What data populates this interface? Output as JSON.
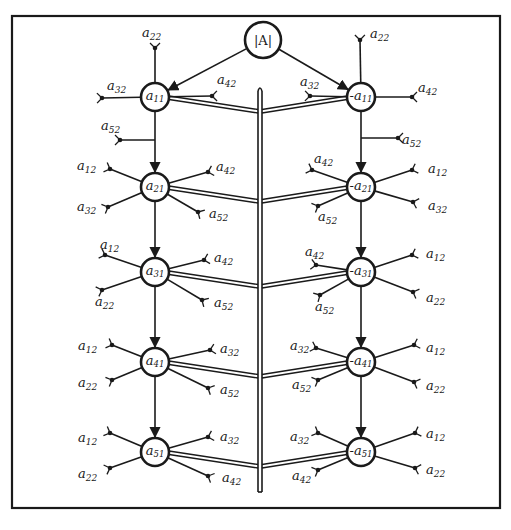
{
  "diagram": {
    "frame": {
      "x": 12,
      "y": 16,
      "width": 488,
      "height": 492
    },
    "colors": {
      "ink": "#1a1a1a",
      "paper": "#ffffff"
    },
    "root": {
      "id": "A",
      "label": "|A|",
      "x": 263,
      "y": 40,
      "r": 18
    },
    "trunk": {
      "x": 260,
      "y_top": 88,
      "y_bottom": 492
    },
    "left_nodes": [
      {
        "id": "a11",
        "base": "a",
        "sub": "11",
        "sign": "",
        "x": 155,
        "y": 97
      },
      {
        "id": "a21",
        "base": "a",
        "sub": "21",
        "sign": "",
        "x": 155,
        "y": 187
      },
      {
        "id": "a31",
        "base": "a",
        "sub": "31",
        "sign": "",
        "x": 155,
        "y": 272
      },
      {
        "id": "a41",
        "base": "a",
        "sub": "41",
        "sign": "",
        "x": 155,
        "y": 362
      },
      {
        "id": "a51",
        "base": "a",
        "sub": "51",
        "sign": "",
        "x": 155,
        "y": 452
      }
    ],
    "right_nodes": [
      {
        "id": "-a11",
        "base": "a",
        "sub": "11",
        "sign": "-",
        "x": 361,
        "y": 97
      },
      {
        "id": "-a21",
        "base": "a",
        "sub": "21",
        "sign": "-",
        "x": 361,
        "y": 187
      },
      {
        "id": "-a31",
        "base": "a",
        "sub": "31",
        "sign": "-",
        "x": 361,
        "y": 272
      },
      {
        "id": "-a41",
        "base": "a",
        "sub": "41",
        "sign": "-",
        "x": 361,
        "y": 362
      },
      {
        "id": "-a51",
        "base": "a",
        "sub": "51",
        "sign": "-",
        "x": 361,
        "y": 452
      }
    ],
    "branches": [
      {
        "node": "a11",
        "label": "a",
        "sub": "22",
        "x2": 155,
        "y2": 48,
        "lx": 142,
        "ly": 37
      },
      {
        "node": "a11",
        "label": "a",
        "sub": "32",
        "x2": 102,
        "y2": 98,
        "lx": 107,
        "ly": 90
      },
      {
        "node": "a11",
        "label": "a",
        "sub": "42",
        "x2": 212,
        "y2": 96,
        "lx": 217,
        "ly": 84
      },
      {
        "node": "a11",
        "label": "a",
        "sub": "52",
        "from": [
          155,
          140
        ],
        "x2": 120,
        "y2": 140,
        "lx": 101,
        "ly": 130
      },
      {
        "node": "-a11",
        "label": "a",
        "sub": "22",
        "x2": 360,
        "y2": 40,
        "lx": 370,
        "ly": 38
      },
      {
        "node": "-a11",
        "label": "a",
        "sub": "32",
        "x2": 310,
        "y2": 96,
        "lx": 300,
        "ly": 86
      },
      {
        "node": "-a11",
        "label": "a",
        "sub": "42",
        "x2": 412,
        "y2": 97,
        "lx": 418,
        "ly": 92
      },
      {
        "node": "-a11",
        "label": "a",
        "sub": "52",
        "from": [
          361,
          138
        ],
        "x2": 398,
        "y2": 138,
        "lx": 402,
        "ly": 144
      },
      {
        "node": "a21",
        "label": "a",
        "sub": "12",
        "x2": 110,
        "y2": 169,
        "lx": 77,
        "ly": 170
      },
      {
        "node": "a21",
        "label": "a",
        "sub": "32",
        "x2": 108,
        "y2": 207,
        "lx": 77,
        "ly": 211
      },
      {
        "node": "a21",
        "label": "a",
        "sub": "42",
        "x2": 208,
        "y2": 172,
        "lx": 216,
        "ly": 171
      },
      {
        "node": "a21",
        "label": "a",
        "sub": "52",
        "x2": 198,
        "y2": 212,
        "lx": 209,
        "ly": 218
      },
      {
        "node": "-a21",
        "label": "a",
        "sub": "42",
        "x2": 312,
        "y2": 170,
        "lx": 314,
        "ly": 163
      },
      {
        "node": "-a21",
        "label": "a",
        "sub": "12",
        "x2": 412,
        "y2": 170,
        "lx": 428,
        "ly": 173
      },
      {
        "node": "-a21",
        "label": "a",
        "sub": "32",
        "x2": 413,
        "y2": 202,
        "lx": 428,
        "ly": 210
      },
      {
        "node": "-a21",
        "label": "a",
        "sub": "52",
        "x2": 318,
        "y2": 206,
        "lx": 318,
        "ly": 221
      },
      {
        "node": "a31",
        "label": "a",
        "sub": "12",
        "x2": 105,
        "y2": 255,
        "lx": 100,
        "ly": 249
      },
      {
        "node": "a31",
        "label": "a",
        "sub": "22",
        "x2": 102,
        "y2": 290,
        "lx": 95,
        "ly": 306
      },
      {
        "node": "a31",
        "label": "a",
        "sub": "42",
        "x2": 204,
        "y2": 260,
        "lx": 214,
        "ly": 262
      },
      {
        "node": "a31",
        "label": "a",
        "sub": "52",
        "x2": 202,
        "y2": 300,
        "lx": 214,
        "ly": 307
      },
      {
        "node": "-a31",
        "label": "a",
        "sub": "42",
        "x2": 316,
        "y2": 265,
        "lx": 305,
        "ly": 256
      },
      {
        "node": "-a31",
        "label": "a",
        "sub": "52",
        "x2": 320,
        "y2": 295,
        "lx": 315,
        "ly": 311
      },
      {
        "node": "-a31",
        "label": "a",
        "sub": "12",
        "x2": 412,
        "y2": 255,
        "lx": 426,
        "ly": 258
      },
      {
        "node": "-a31",
        "label": "a",
        "sub": "22",
        "x2": 413,
        "y2": 292,
        "lx": 426,
        "ly": 302
      },
      {
        "node": "a41",
        "label": "a",
        "sub": "12",
        "x2": 112,
        "y2": 345,
        "lx": 78,
        "ly": 350
      },
      {
        "node": "a41",
        "label": "a",
        "sub": "22",
        "x2": 112,
        "y2": 380,
        "lx": 78,
        "ly": 387
      },
      {
        "node": "a41",
        "label": "a",
        "sub": "32",
        "x2": 210,
        "y2": 350,
        "lx": 220,
        "ly": 353
      },
      {
        "node": "a41",
        "label": "a",
        "sub": "52",
        "x2": 208,
        "y2": 388,
        "lx": 220,
        "ly": 394
      },
      {
        "node": "-a41",
        "label": "a",
        "sub": "32",
        "x2": 316,
        "y2": 348,
        "lx": 290,
        "ly": 350
      },
      {
        "node": "-a41",
        "label": "a",
        "sub": "52",
        "x2": 318,
        "y2": 380,
        "lx": 292,
        "ly": 389
      },
      {
        "node": "-a41",
        "label": "a",
        "sub": "12",
        "x2": 414,
        "y2": 345,
        "lx": 426,
        "ly": 352
      },
      {
        "node": "-a41",
        "label": "a",
        "sub": "22",
        "x2": 414,
        "y2": 382,
        "lx": 426,
        "ly": 390
      },
      {
        "node": "a51",
        "label": "a",
        "sub": "12",
        "x2": 110,
        "y2": 433,
        "lx": 78,
        "ly": 442
      },
      {
        "node": "a51",
        "label": "a",
        "sub": "22",
        "x2": 110,
        "y2": 468,
        "lx": 78,
        "ly": 478
      },
      {
        "node": "a51",
        "label": "a",
        "sub": "32",
        "x2": 208,
        "y2": 437,
        "lx": 220,
        "ly": 441
      },
      {
        "node": "a51",
        "label": "a",
        "sub": "42",
        "x2": 208,
        "y2": 476,
        "lx": 222,
        "ly": 482
      },
      {
        "node": "-a51",
        "label": "a",
        "sub": "32",
        "x2": 318,
        "y2": 433,
        "lx": 290,
        "ly": 441
      },
      {
        "node": "-a51",
        "label": "a",
        "sub": "42",
        "x2": 318,
        "y2": 470,
        "lx": 292,
        "ly": 480
      },
      {
        "node": "-a51",
        "label": "a",
        "sub": "12",
        "x2": 415,
        "y2": 433,
        "lx": 426,
        "ly": 438
      },
      {
        "node": "-a51",
        "label": "a",
        "sub": "22",
        "x2": 415,
        "y2": 468,
        "lx": 426,
        "ly": 474
      }
    ]
  }
}
